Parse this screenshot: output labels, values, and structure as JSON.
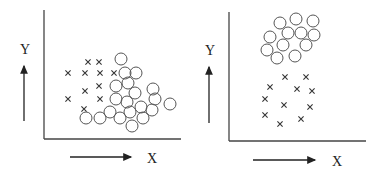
{
  "chart_data": [
    {
      "type": "scatter",
      "title": "",
      "xlabel": "X",
      "ylabel": "Y",
      "grid": false,
      "legend": null,
      "description": "Overlapping clusters",
      "series": [
        {
          "name": "crosses",
          "marker": "x",
          "points": [
            [
              68,
              73
            ],
            [
              85,
              73
            ],
            [
              100,
              73
            ],
            [
              114,
              73
            ],
            [
              88,
              62
            ],
            [
              99,
              62
            ],
            [
              85,
              91
            ],
            [
              99,
              86
            ],
            [
              68,
              99
            ],
            [
              100,
              99
            ],
            [
              84,
              109
            ]
          ]
        },
        {
          "name": "circles",
          "marker": "o",
          "points": [
            [
              121,
              59
            ],
            [
              125,
              73
            ],
            [
              136,
              73
            ],
            [
              116,
              86
            ],
            [
              128,
              83
            ],
            [
              135,
              93
            ],
            [
              153,
              89
            ],
            [
              116,
              99
            ],
            [
              127,
              102
            ],
            [
              155,
              99
            ],
            [
              170,
              104
            ],
            [
              110,
              112
            ],
            [
              141,
              107
            ],
            [
              130,
              112
            ],
            [
              152,
              110
            ],
            [
              86,
              118
            ],
            [
              100,
              118
            ],
            [
              120,
              118
            ],
            [
              143,
              118
            ],
            [
              132,
              126
            ]
          ]
        }
      ]
    },
    {
      "type": "scatter",
      "title": "",
      "xlabel": "X",
      "ylabel": "Y",
      "grid": false,
      "legend": null,
      "description": "Separated clusters",
      "series": [
        {
          "name": "circles",
          "marker": "o",
          "points": [
            [
              280,
              23
            ],
            [
              296,
              19
            ],
            [
              313,
              21
            ],
            [
              270,
              37
            ],
            [
              288,
              33
            ],
            [
              301,
              33
            ],
            [
              314,
              35
            ],
            [
              267,
              50
            ],
            [
              283,
              45
            ],
            [
              306,
              45
            ],
            [
              277,
              58
            ],
            [
              295,
              56
            ]
          ]
        },
        {
          "name": "crosses",
          "marker": "x",
          "points": [
            [
              285,
              77
            ],
            [
              306,
              77
            ],
            [
              270,
              87
            ],
            [
              297,
              89
            ],
            [
              312,
              91
            ],
            [
              265,
              99
            ],
            [
              284,
              105
            ],
            [
              310,
              107
            ],
            [
              265,
              115
            ],
            [
              280,
              124
            ],
            [
              301,
              119
            ]
          ]
        }
      ]
    }
  ],
  "plots": [
    {
      "ylabel": "Y",
      "xlabel": "X"
    },
    {
      "ylabel": "Y",
      "xlabel": "X"
    }
  ],
  "colors": {
    "ink": "#333333",
    "marker": "#555555"
  }
}
